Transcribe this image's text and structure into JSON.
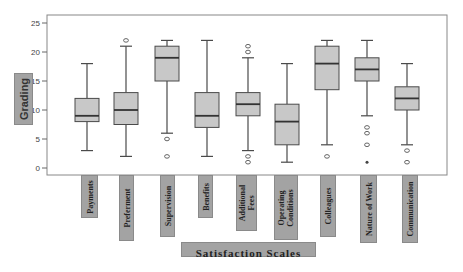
{
  "chart_data": {
    "type": "boxplot",
    "title": "",
    "xlabel": "Satisfaction Scales",
    "ylabel": "Grading",
    "ylim": [
      0,
      25
    ],
    "yticks": [
      0,
      5,
      10,
      15,
      20,
      25
    ],
    "grid": false,
    "legend": null,
    "categories": [
      "Payments",
      "Preferment",
      "Supervision",
      "Benefits",
      "Additional Fees",
      "Operating Conditions",
      "Colleagues",
      "Nature of Work",
      "Communication"
    ],
    "series": [
      {
        "name": "Payments",
        "whisker_low": 3,
        "q1": 8,
        "median": 9,
        "q3": 12,
        "whisker_high": 18,
        "outliers": [],
        "extremes": []
      },
      {
        "name": "Preferment",
        "whisker_low": 2,
        "q1": 7.5,
        "median": 10,
        "q3": 13,
        "whisker_high": 21,
        "outliers": [
          22
        ],
        "extremes": []
      },
      {
        "name": "Supervision",
        "whisker_low": 6,
        "q1": 15,
        "median": 19,
        "q3": 21,
        "whisker_high": 22,
        "outliers": [
          5,
          2
        ],
        "extremes": []
      },
      {
        "name": "Benefits",
        "whisker_low": 2,
        "q1": 7,
        "median": 9,
        "q3": 13,
        "whisker_high": 22,
        "outliers": [],
        "extremes": []
      },
      {
        "name": "Additional Fees",
        "whisker_low": 3,
        "q1": 9,
        "median": 11,
        "q3": 13,
        "whisker_high": 19,
        "outliers": [
          21,
          20,
          2,
          1
        ],
        "extremes": []
      },
      {
        "name": "Operating Conditions",
        "whisker_low": 1,
        "q1": 4,
        "median": 8,
        "q3": 11,
        "whisker_high": 18,
        "outliers": [],
        "extremes": []
      },
      {
        "name": "Colleagues",
        "whisker_low": 4,
        "q1": 13.5,
        "median": 18,
        "q3": 21,
        "whisker_high": 22,
        "outliers": [
          2
        ],
        "extremes": []
      },
      {
        "name": "Nature of Work",
        "whisker_low": 9,
        "q1": 15,
        "median": 17,
        "q3": 19,
        "whisker_high": 22,
        "outliers": [
          7,
          6,
          4
        ],
        "extremes": [
          1
        ]
      },
      {
        "name": "Communication",
        "whisker_low": 4,
        "q1": 10,
        "median": 12,
        "q3": 14,
        "whisker_high": 18,
        "outliers": [
          3,
          1
        ],
        "extremes": []
      }
    ]
  },
  "labels": {
    "ylabel": "Grading",
    "xlabel": "Satisfaction Scales",
    "categories": [
      "Payments",
      "Preferment",
      "Supervision",
      "Benefits",
      "Additional\nFees",
      "Operating\nConditions",
      "Colleagues",
      "Nature of Work",
      "Communication"
    ]
  },
  "colors": {
    "box_fill": "#c8c8c8",
    "box_stroke": "#4a4a4a",
    "frame": "#888888",
    "label_fill": "#a3a3a3"
  }
}
